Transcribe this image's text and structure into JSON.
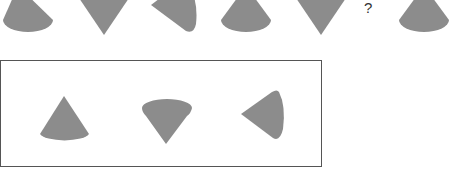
{
  "puzzle": {
    "sequence": [
      {
        "index": 1,
        "shape": "cone-upright",
        "orientation": "tip-up"
      },
      {
        "index": 2,
        "shape": "cone-inverted",
        "orientation": "tip-down"
      },
      {
        "index": 3,
        "shape": "cone-sideways",
        "orientation": "tip-left"
      },
      {
        "index": 4,
        "shape": "cone-upright",
        "orientation": "tip-up"
      },
      {
        "index": 5,
        "shape": "cone-inverted",
        "orientation": "tip-down"
      },
      {
        "index": 6,
        "shape": "unknown",
        "label": "?"
      },
      {
        "index": 7,
        "shape": "cone-upright",
        "orientation": "tip-up"
      }
    ],
    "question_mark": "?",
    "options": [
      {
        "index": 1,
        "shape": "cone-upright",
        "orientation": "tip-up"
      },
      {
        "index": 2,
        "shape": "cone-inverted",
        "orientation": "tip-down"
      },
      {
        "index": 3,
        "shape": "cone-sideways",
        "orientation": "tip-left"
      }
    ]
  },
  "colors": {
    "shape_fill": "#8c8c8c",
    "box_border": "#555555",
    "background": "#ffffff"
  }
}
